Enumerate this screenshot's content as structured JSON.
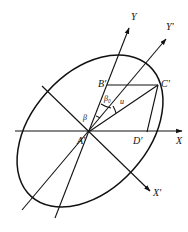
{
  "diagram": {
    "type": "geometric-construction",
    "axes": {
      "x": "X",
      "y": "Y",
      "x_prime": "X'",
      "y_prime": "Y'"
    },
    "points": {
      "center": "A'",
      "b": "B'",
      "c": "C'",
      "d": "D'"
    },
    "angles": {
      "beta": "β",
      "beta0": "β₀",
      "u": "u"
    },
    "colors": {
      "stroke": "#111111",
      "background": "#ffffff"
    }
  }
}
